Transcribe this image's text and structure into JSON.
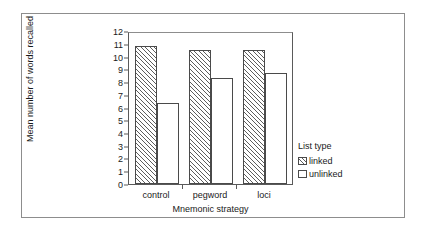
{
  "chart_data": {
    "type": "bar",
    "title": "",
    "subtitle": "",
    "xlabel": "Mnemonic strategy",
    "ylabel": "Mean number of words recalled",
    "categories": [
      "control",
      "pegword",
      "loci"
    ],
    "series": [
      {
        "name": "linked",
        "values": [
          11.0,
          10.65,
          10.65
        ]
      },
      {
        "name": "unlinked",
        "values": [
          6.4,
          8.4,
          8.85
        ]
      }
    ],
    "ylim": [
      0,
      12
    ],
    "ytick_step": 1,
    "yticks": [
      "12",
      "11",
      "10",
      "9",
      "8",
      "7",
      "6",
      "5",
      "4",
      "3",
      "2",
      "1",
      "0"
    ],
    "grid": false,
    "legend_position": "right",
    "legend": {
      "title": "List type",
      "entries": [
        {
          "label": "linked",
          "pattern": "diagonal-hatch",
          "color": "#ffffff"
        },
        {
          "label": "unlinked",
          "pattern": "solid",
          "color": "#ffffff"
        }
      ]
    },
    "colors": {
      "bar_outline": "#4a4a4a",
      "hatch": "#5d5d5d",
      "axis": "#5a5a5a",
      "frame": "#8d8d8d",
      "background": "#ffffff",
      "text": "#1a1a1a"
    }
  }
}
